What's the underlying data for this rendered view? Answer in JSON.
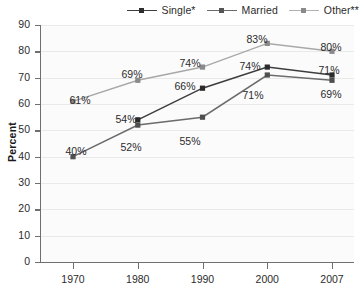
{
  "legend": {
    "items": [
      {
        "label": "Single*",
        "color": "#3d3d3d",
        "marker_name": "legend-marker-single"
      },
      {
        "label": "Married",
        "color": "#6b6b6b",
        "marker_name": "legend-marker-married"
      },
      {
        "label": "Other**",
        "color": "#a8a8a8",
        "marker_name": "legend-marker-other"
      }
    ]
  },
  "chart_data": {
    "type": "line",
    "title": "",
    "xlabel": "",
    "ylabel": "Percent",
    "categories": [
      "1970",
      "1980",
      "1990",
      "2000",
      "2007"
    ],
    "x_tick_labels": [
      "1970",
      "1980",
      "1990",
      "2000",
      "2007"
    ],
    "y_tick_labels": [
      "0",
      "10",
      "20",
      "30",
      "40",
      "50",
      "60",
      "70",
      "80",
      "90"
    ],
    "ylim": [
      0,
      90
    ],
    "ytick_step": 10,
    "grid": true,
    "legend_position": "top-right",
    "series": [
      {
        "name": "Single*",
        "color": "#3d3d3d",
        "values": [
          null,
          54,
          66,
          74,
          71
        ],
        "labels": [
          "",
          "54%",
          "66%",
          "74%",
          "71%"
        ]
      },
      {
        "name": "Married",
        "color": "#6b6b6b",
        "values": [
          40,
          52,
          55,
          71,
          69
        ],
        "labels": [
          "40%",
          "52%",
          "55%",
          "71%",
          "69%"
        ]
      },
      {
        "name": "Other**",
        "color": "#a8a8a8",
        "values": [
          61,
          69,
          74,
          83,
          80
        ],
        "labels": [
          "61%",
          "69%",
          "74%",
          "83%",
          "80%"
        ]
      }
    ],
    "annotations": [
      {
        "text": "61%",
        "x": "1970",
        "y": 61,
        "series": "Other**"
      },
      {
        "text": "40%",
        "x": "1970",
        "y": 40,
        "series": "Married"
      },
      {
        "text": "69%",
        "x": "1980",
        "y": 69,
        "series": "Other**"
      },
      {
        "text": "54%",
        "x": "1980",
        "y": 54,
        "series": "Single*"
      },
      {
        "text": "52%",
        "x": "1980",
        "y": 52,
        "series": "Married"
      },
      {
        "text": "74%",
        "x": "1990",
        "y": 74,
        "series": "Other**"
      },
      {
        "text": "66%",
        "x": "1990",
        "y": 66,
        "series": "Single*"
      },
      {
        "text": "55%",
        "x": "1990",
        "y": 55,
        "series": "Married"
      },
      {
        "text": "83%",
        "x": "2000",
        "y": 83,
        "series": "Other**"
      },
      {
        "text": "74%",
        "x": "2000",
        "y": 74,
        "series": "Single*"
      },
      {
        "text": "71%",
        "x": "2000",
        "y": 71,
        "series": "Married"
      },
      {
        "text": "80%",
        "x": "2007",
        "y": 80,
        "series": "Other**"
      },
      {
        "text": "71%",
        "x": "2007",
        "y": 71,
        "series": "Single*"
      },
      {
        "text": "69%",
        "x": "2007",
        "y": 69,
        "series": "Married"
      }
    ]
  },
  "label_positions": [
    {
      "text": "61%",
      "left": 80,
      "top": 82,
      "name": "data-label-other-1970"
    },
    {
      "text": "40%",
      "left": 76,
      "top": 133,
      "name": "data-label-married-1970"
    },
    {
      "text": "69%",
      "left": 132,
      "top": 56,
      "name": "data-label-other-1980"
    },
    {
      "text": "54%",
      "left": 126,
      "top": 101,
      "name": "data-label-single-1980"
    },
    {
      "text": "52%",
      "left": 131,
      "top": 129,
      "name": "data-label-married-1980"
    },
    {
      "text": "74%",
      "left": 190,
      "top": 45,
      "name": "data-label-other-1990"
    },
    {
      "text": "66%",
      "left": 185,
      "top": 68,
      "name": "data-label-single-1990"
    },
    {
      "text": "55%",
      "left": 190,
      "top": 123,
      "name": "data-label-married-1990"
    },
    {
      "text": "83%",
      "left": 257,
      "top": 21,
      "name": "data-label-other-2000"
    },
    {
      "text": "74%",
      "left": 250,
      "top": 48,
      "name": "data-label-single-2000"
    },
    {
      "text": "71%",
      "left": 253,
      "top": 77,
      "name": "data-label-married-2000"
    },
    {
      "text": "80%",
      "left": 331,
      "top": 29,
      "name": "data-label-other-2007"
    },
    {
      "text": "71%",
      "left": 329,
      "top": 52,
      "name": "data-label-single-2007"
    },
    {
      "text": "69%",
      "left": 331,
      "top": 76,
      "name": "data-label-married-2007"
    }
  ]
}
